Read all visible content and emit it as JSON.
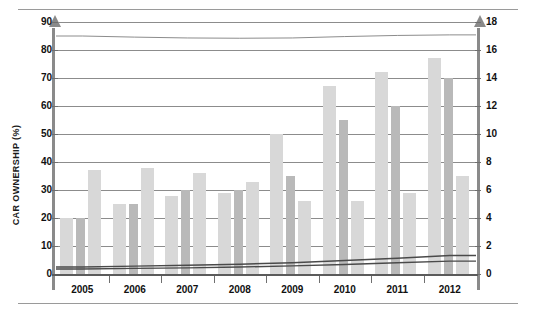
{
  "chart_data": {
    "type": "bar",
    "title": "",
    "subtitle": "",
    "categories": [
      "2005",
      "2006",
      "2007",
      "2008",
      "2009",
      "2010",
      "2011",
      "2012"
    ],
    "xlabel": "",
    "ylabel": "CAR OWNERSHIP (%)",
    "y2label": "ANNUAL SALES (MILLION CARS)",
    "ylim": [
      0,
      90
    ],
    "y2lim": [
      0,
      18
    ],
    "yticks": [
      0,
      10,
      20,
      30,
      40,
      50,
      60,
      70,
      80,
      90
    ],
    "y2ticks": [
      0,
      2,
      4,
      6,
      8,
      10,
      12,
      14,
      16,
      18
    ],
    "grid": true,
    "legend": "none",
    "series": [
      {
        "name": "Car ownership bar 1",
        "axis": "left",
        "kind": "bar",
        "color": "#d8d8d8",
        "values": [
          20,
          25,
          28,
          29,
          50,
          67,
          72,
          77
        ]
      },
      {
        "name": "Annual sales",
        "axis": "right",
        "kind": "bar",
        "color": "#b9b9b9",
        "values": [
          4,
          5,
          6,
          6,
          7,
          11,
          12,
          14
        ]
      },
      {
        "name": "Car ownership bar 2",
        "axis": "left",
        "kind": "bar",
        "color": "#d8d8d8",
        "values": [
          37,
          38,
          36,
          33,
          26,
          26,
          29,
          35
        ]
      },
      {
        "name": "Trend line upper",
        "axis": "left",
        "kind": "line",
        "color": "#4a4a4a",
        "values": [
          2.5,
          2.8,
          3.1,
          3.5,
          4.0,
          4.8,
          5.6,
          6.6
        ]
      },
      {
        "name": "Trend line lower",
        "axis": "left",
        "kind": "line",
        "color": "#4a4a4a",
        "values": [
          1.8,
          2.0,
          2.2,
          2.5,
          2.9,
          3.4,
          4.0,
          4.6
        ]
      },
      {
        "name": "Upper reference line",
        "axis": "left",
        "kind": "line",
        "color": "#8c8c8c",
        "values": [
          85,
          84.6,
          84.3,
          84.2,
          84.3,
          84.8,
          85.2,
          85.4
        ]
      }
    ]
  },
  "axes": {
    "left": {
      "title": "CAR OWNERSHIP (%)",
      "labels": [
        "90",
        "80",
        "70",
        "60",
        "50",
        "40",
        "30",
        "20",
        "10",
        "0"
      ]
    },
    "right": {
      "title": "ANNUAL SALES (MILLION CARS)",
      "labels": [
        "18",
        "16",
        "14",
        "12",
        "10",
        "8",
        "6",
        "4",
        "2",
        "0"
      ]
    },
    "bottom": {
      "labels": [
        "2005",
        "2006",
        "2007",
        "2008",
        "2009",
        "2010",
        "2011",
        "2012"
      ]
    }
  },
  "colors": {
    "bar_light": "#d8d8d8",
    "bar_mid": "#b9b9b9",
    "gridline": "#8c8c8c",
    "axis": "#8a8a8a",
    "line": "#4a4a4a",
    "text": "#111111",
    "background": "#ffffff"
  }
}
